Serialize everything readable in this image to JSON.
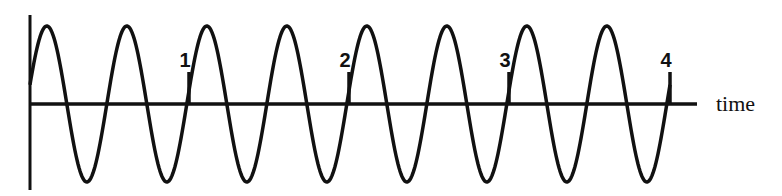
{
  "diagram": {
    "type": "sine-wave-timeline",
    "axis_label": "time",
    "markers": [
      {
        "label": "1",
        "x": 189
      },
      {
        "label": "2",
        "x": 349
      },
      {
        "label": "3",
        "x": 509
      },
      {
        "label": "4",
        "x": 670
      }
    ],
    "wave": {
      "cycles": 8,
      "cycles_per_marker_interval": 2,
      "period_px": 80,
      "amplitude_px": 78,
      "start_x": 30,
      "end_x": 670,
      "baseline_y": 104
    },
    "colors": {
      "line": "#111111",
      "background": "#ffffff"
    }
  }
}
